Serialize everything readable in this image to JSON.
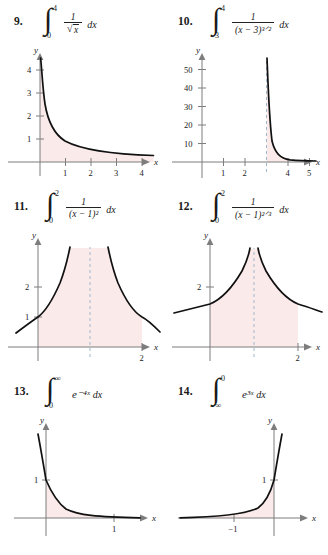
{
  "page": {
    "kind": "textbook-exercise-set",
    "topic": "improper integrals"
  },
  "problems": [
    {
      "number": "9.",
      "integral_lower": "0",
      "integral_upper": "4",
      "integrand_numerator": "1",
      "integrand_denominator": "√x",
      "differential": "dx",
      "statement_text": "9.  ∫₀⁴ 1/√x dx",
      "graph": {
        "type": "line",
        "function": "y = 1/√x",
        "x_axis_label": "x",
        "y_axis_label": "y",
        "x_ticks": [
          "1",
          "2",
          "3",
          "4"
        ],
        "y_ticks": [
          "1",
          "2",
          "3",
          "4"
        ],
        "xlim": [
          -0.55,
          5.0
        ],
        "ylim": [
          -0.9,
          5.0
        ],
        "shaded_from": 0,
        "shaded_to": 4.45,
        "asymptote": null,
        "asymptote_label": "",
        "shade_color": "#fbeaea",
        "curve_color": "#111111",
        "axis_color": "#7d7d7d"
      }
    },
    {
      "number": "10.",
      "integral_lower": "3",
      "integral_upper": "4",
      "integrand_numerator": "1",
      "integrand_denominator": "(x − 3)³ᐟ²",
      "differential": "dx",
      "statement_text": "10.  ∫₃⁴ 1/(x − 3)^(3/2) dx",
      "graph": {
        "type": "line",
        "function": "y = 1/(x − 3)^(3/2)",
        "x_axis_label": "x",
        "y_axis_label": "y",
        "x_ticks": [
          "1",
          "2",
          "4",
          "5"
        ],
        "y_ticks": [
          "10",
          "20",
          "30",
          "40",
          "50"
        ],
        "xlim": [
          -0.8,
          6.0
        ],
        "ylim": [
          -14,
          60
        ],
        "shaded_from": 3,
        "shaded_to": 5.6,
        "asymptote": 3,
        "asymptote_label": "x = 3",
        "shade_color": "#fbeaea",
        "curve_color": "#111111",
        "axis_color": "#7d7d7d",
        "asymptote_color": "#9fb8cc"
      }
    },
    {
      "number": "11.",
      "integral_lower": "0",
      "integral_upper": "2",
      "integrand_numerator": "1",
      "integrand_denominator": "(x − 1)²",
      "differential": "dx",
      "statement_text": "11.  ∫₀² 1/(x − 1)² dx",
      "graph": {
        "type": "line",
        "function": "y = 1/(x − 1)²",
        "x_axis_label": "x",
        "y_axis_label": "y",
        "x_ticks": [
          "2"
        ],
        "y_ticks": [
          "1",
          "2"
        ],
        "xlim": [
          -0.75,
          2.9
        ],
        "ylim": [
          -1.0,
          3.6
        ],
        "shaded_from": 0,
        "shaded_to": 2,
        "asymptote": 1,
        "asymptote_label": "x = 1",
        "shade_color": "#fbeaea",
        "curve_color": "#111111",
        "axis_color": "#7d7d7d",
        "asymptote_color": "#9fb8cc"
      }
    },
    {
      "number": "12.",
      "integral_lower": "0",
      "integral_upper": "2",
      "integrand_numerator": "1",
      "integrand_denominator": "(x − 1)²ᐟ³",
      "differential": "dx",
      "statement_text": "12.  ∫₀² 1/(x − 1)^(2/3) dx",
      "graph": {
        "type": "line",
        "function": "y = 1/(x − 1)^(2/3)",
        "x_axis_label": "x",
        "y_axis_label": "y",
        "x_ticks": [
          "2"
        ],
        "y_ticks": [
          "2"
        ],
        "xlim": [
          -1.35,
          2.9
        ],
        "ylim": [
          -1.0,
          3.6
        ],
        "shaded_from": 0,
        "shaded_to": 2,
        "asymptote": 1,
        "asymptote_label": "x = 1",
        "shade_color": "#fbeaea",
        "curve_color": "#111111",
        "axis_color": "#7d7d7d",
        "asymptote_color": "#9fb8cc"
      }
    },
    {
      "number": "13.",
      "integral_lower": "0",
      "integral_upper": "∞",
      "integrand": "e⁻⁴ˣ",
      "differential": "dx",
      "statement_text": "13.  ∫₀^∞ e^(−4x) dx",
      "graph": {
        "type": "line",
        "function": "y = e^(−4x)",
        "x_axis_label": "x",
        "y_axis_label": "y",
        "x_ticks": [
          "1"
        ],
        "y_ticks": [
          "1"
        ],
        "xlim": [
          -0.55,
          1.85
        ],
        "ylim": [
          -0.55,
          1.75
        ],
        "shaded_from": 0,
        "shaded_to": 1.7,
        "asymptote": null,
        "asymptote_label": "",
        "shade_color": "#fbeaea",
        "curve_color": "#111111",
        "axis_color": "#7d7d7d"
      }
    },
    {
      "number": "14.",
      "integral_lower": "−∞",
      "integral_upper": "0",
      "integrand": "e³ˣ",
      "differential": "dx",
      "statement_text": "14.  ∫_(−∞)^0 e^(3x) dx",
      "graph": {
        "type": "line",
        "function": "y = e^(3x)",
        "x_axis_label": "x",
        "y_axis_label": "y",
        "x_ticks": [
          "−1"
        ],
        "y_ticks": [
          "1"
        ],
        "xlim": [
          -2.2,
          0.85
        ],
        "ylim": [
          -0.6,
          1.8
        ],
        "shaded_from": -2.1,
        "shaded_to": 0,
        "asymptote": null,
        "asymptote_label": "",
        "shade_color": "#fbeaea",
        "curve_color": "#111111",
        "axis_color": "#7d7d7d"
      }
    }
  ]
}
